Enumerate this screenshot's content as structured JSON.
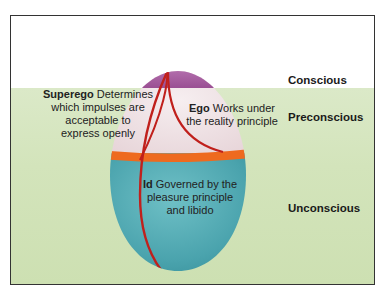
{
  "diagram": {
    "levels": [
      {
        "label": "Conscious"
      },
      {
        "label": "Preconscious"
      },
      {
        "label": "Unconscious"
      }
    ],
    "parts": {
      "superego": {
        "name": "Superego",
        "line1_rest": " Determines",
        "line2": "which impulses are",
        "line3": "acceptable to",
        "line4": "express openly"
      },
      "ego": {
        "name": "Ego",
        "line1_rest": " Works under",
        "line2": "the reality principle"
      },
      "id": {
        "name": "Id",
        "line1_rest": " Governed by the",
        "line2": "pleasure principle",
        "line3": "and libido"
      }
    },
    "colors": {
      "conscious_cap": "#a85aa0",
      "preconscious_region": "#efe2e4",
      "unconscious_region": "#4aa3ad",
      "divider_band": "#ee6a1f",
      "boundary_lines": "#c0201c",
      "background_green": "#d3e4bb"
    }
  }
}
